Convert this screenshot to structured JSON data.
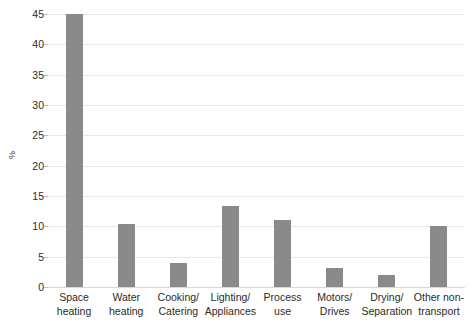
{
  "chart_data": {
    "type": "bar",
    "title": "",
    "xlabel": "",
    "ylabel": "%",
    "ylim": [
      0,
      45
    ],
    "ytick_step": 5,
    "yticks": [
      0,
      5,
      10,
      15,
      20,
      25,
      30,
      35,
      40,
      45
    ],
    "ytick_labels": [
      "0",
      "5",
      "10",
      "15",
      "20",
      "25",
      "30",
      "35",
      "40",
      "45"
    ],
    "grid": true,
    "legend": "none",
    "bar_color": "#8a8a8a",
    "gridline_color": "#e9e9e9",
    "background_color": "#ffffff",
    "categories": [
      "Space heating",
      "Water heating",
      "Cooking/ Catering",
      "Lighting/ Appliances",
      "Process use",
      "Motors/ Drives",
      "Drying/ Separation",
      "Other non-transport"
    ],
    "category_lines": [
      [
        "Space",
        "heating"
      ],
      [
        "Water",
        "heating"
      ],
      [
        "Cooking/",
        "Catering"
      ],
      [
        "Lighting/",
        "Appliances"
      ],
      [
        "Process",
        "use"
      ],
      [
        "Motors/",
        "Drives"
      ],
      [
        "Drying/",
        "Separation"
      ],
      [
        "Other non-",
        "transport"
      ]
    ],
    "values": [
      45.0,
      10.4,
      4.0,
      13.4,
      11.0,
      3.2,
      2.0,
      10.1
    ]
  }
}
